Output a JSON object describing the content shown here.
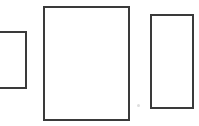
{
  "canvas": {
    "width": 199,
    "height": 126,
    "background_color": "#ffffff",
    "description": "Scanned line drawing of three empty upright rectangles outlined in dark gray on a white background"
  },
  "style": {
    "stroke_color": "#3a3a3a",
    "stroke_width_px": 2,
    "fill_color": "#ffffff"
  },
  "shapes": [
    {
      "id": "rectangle-1",
      "label": "Left rectangle",
      "shape": "rectangle",
      "x": -8,
      "y": 31,
      "width": 35,
      "height": 58,
      "stroke_color": "#3a3a3a",
      "stroke_width_px": 2,
      "fill_color": "#ffffff",
      "clipped_edge": "left"
    },
    {
      "id": "rectangle-2",
      "label": "Center rectangle",
      "shape": "rectangle",
      "x": 43,
      "y": 6,
      "width": 87,
      "height": 115,
      "stroke_color": "#3a3a3a",
      "stroke_width_px": 2,
      "fill_color": "#ffffff",
      "clipped_edge": "none"
    },
    {
      "id": "rectangle-3",
      "label": "Right rectangle",
      "shape": "rectangle",
      "x": 150,
      "y": 14,
      "width": 44,
      "height": 95,
      "stroke_color": "#3a3a3a",
      "stroke_width_px": 2,
      "fill_color": "#ffffff",
      "clipped_edge": "none"
    }
  ],
  "artifacts": [
    {
      "id": "scan-speck",
      "label": "Faint scanning speck",
      "x": 137,
      "y": 104,
      "size": 3,
      "color": "#d8d8d8"
    }
  ]
}
